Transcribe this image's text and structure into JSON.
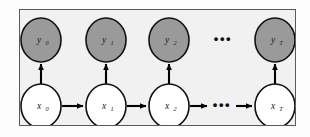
{
  "figure": {
    "type": "graphical-model-diagram",
    "model_name": "hidden-markov-model",
    "frame": {
      "x": 19,
      "y": 9,
      "width": 277,
      "height": 117,
      "background_color": "#f1f1f1",
      "border_color": "#5a5a5a"
    },
    "page_background_color": "#fdfdfd"
  },
  "colors": {
    "observed_node_fill": "#9a9a9a",
    "latent_node_fill": "#ffffff",
    "node_stroke": "#111111",
    "edge_color": "#000000",
    "label_color": "#1a1a1a"
  },
  "layout": {
    "observed_row_cy": 30,
    "latent_row_cy": 96,
    "node_rx": 20,
    "node_ry": 22,
    "column_cx": [
      21,
      86,
      149,
      255
    ],
    "ellipsis_cx": 203
  },
  "observed_row": {
    "row_label": "observations",
    "nodes": [
      {
        "id": "y0",
        "base": "y",
        "sub": "0",
        "cx": 21,
        "shaded": true
      },
      {
        "id": "y1",
        "base": "y",
        "sub": "1",
        "cx": 86,
        "shaded": true
      },
      {
        "id": "y2",
        "base": "y",
        "sub": "2",
        "cx": 149,
        "shaded": true
      },
      {
        "id": "yT",
        "base": "y",
        "sub": "T",
        "cx": 255,
        "shaded": true
      }
    ],
    "ellipsis": "•••"
  },
  "latent_row": {
    "row_label": "latent-states",
    "nodes": [
      {
        "id": "x0",
        "base": "x",
        "sub": "0",
        "cx": 21,
        "shaded": false
      },
      {
        "id": "x1",
        "base": "x",
        "sub": "1",
        "cx": 86,
        "shaded": false
      },
      {
        "id": "x2",
        "base": "x",
        "sub": "2",
        "cx": 149,
        "shaded": false
      },
      {
        "id": "xT",
        "base": "x",
        "sub": "T",
        "cx": 255,
        "shaded": false
      }
    ],
    "ellipsis": "•••"
  },
  "edges": {
    "emission_label": "emission-arrow",
    "transition_label": "transition-arrow",
    "emissions": [
      {
        "from": "x0",
        "to": "y0",
        "cx": 21
      },
      {
        "from": "x1",
        "to": "y1",
        "cx": 86
      },
      {
        "from": "x2",
        "to": "y2",
        "cx": 149
      },
      {
        "from": "xT",
        "to": "yT",
        "cx": 255
      }
    ],
    "transitions": [
      {
        "from": "x0",
        "to": "x1",
        "x_start": 42,
        "x_end": 64
      },
      {
        "from": "x1",
        "to": "x2",
        "x_start": 107,
        "x_end": 127
      },
      {
        "from": "x2",
        "to": "ellipsis",
        "x_start": 170,
        "x_end": 188
      },
      {
        "from": "ellipsis",
        "to": "xT",
        "x_start": 216,
        "x_end": 233
      }
    ]
  }
}
